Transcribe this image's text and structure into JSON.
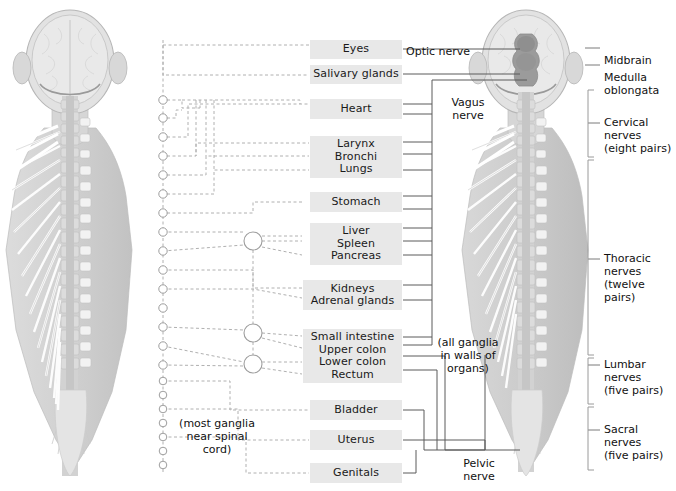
{
  "diagram": {
    "colors": {
      "box_fill": "#e8e8e8",
      "text": "#1a1a1a",
      "solid_line": "#555555",
      "dashed_line": "#aaaaaa",
      "bracket": "#888888",
      "figure_gray": "#c9c9c9",
      "figure_light": "#e4e4e4",
      "figure_dark": "#9a9a9a",
      "cord_dark": "#8d8d8d"
    },
    "organ_boxes": [
      {
        "id": "eyes",
        "lines": [
          "Eyes"
        ],
        "x": 310,
        "y": 40,
        "w": 92,
        "h": 19
      },
      {
        "id": "salivary",
        "lines": [
          "Salivary glands"
        ],
        "x": 310,
        "y": 65,
        "w": 92,
        "h": 19
      },
      {
        "id": "heart",
        "lines": [
          "Heart"
        ],
        "x": 310,
        "y": 99,
        "w": 92,
        "h": 20
      },
      {
        "id": "airway",
        "lines": [
          "Larynx",
          "Bronchi",
          "Lungs"
        ],
        "x": 310,
        "y": 136,
        "w": 92,
        "h": 42
      },
      {
        "id": "stomach",
        "lines": [
          "Stomach"
        ],
        "x": 310,
        "y": 192,
        "w": 92,
        "h": 20
      },
      {
        "id": "liver",
        "lines": [
          "Liver",
          "Spleen",
          "Pancreas"
        ],
        "x": 310,
        "y": 223,
        "w": 92,
        "h": 42
      },
      {
        "id": "kidneys",
        "lines": [
          "Kidneys",
          "Adrenal glands"
        ],
        "x": 303,
        "y": 280,
        "w": 99,
        "h": 30
      },
      {
        "id": "intestine",
        "lines": [
          "Small intestine",
          "Upper colon",
          "Lower colon",
          "Rectum"
        ],
        "x": 303,
        "y": 329,
        "w": 99,
        "h": 54
      },
      {
        "id": "bladder",
        "lines": [
          "Bladder"
        ],
        "x": 310,
        "y": 400,
        "w": 92,
        "h": 20
      },
      {
        "id": "uterus",
        "lines": [
          "Uterus"
        ],
        "x": 310,
        "y": 430,
        "w": 92,
        "h": 20
      },
      {
        "id": "genitals",
        "lines": [
          "Genitals"
        ],
        "x": 310,
        "y": 463,
        "w": 92,
        "h": 20
      }
    ],
    "nerve_labels": [
      {
        "id": "optic-nerve",
        "lines": [
          "Optic nerve"
        ],
        "x": 406,
        "y": 32,
        "w": 86,
        "align": "left"
      },
      {
        "id": "vagus-nerve",
        "lines": [
          "Vagus",
          "nerve"
        ],
        "x": 440,
        "y": 83,
        "w": 56,
        "align": "center"
      },
      {
        "id": "all-ganglia",
        "lines": [
          "(all ganglia",
          "in walls of",
          "organs)"
        ],
        "x": 434,
        "y": 323,
        "w": 68,
        "align": "center"
      },
      {
        "id": "pelvic-nerve",
        "lines": [
          "Pelvic",
          "nerve"
        ],
        "x": 452,
        "y": 444,
        "w": 52,
        "align": "center"
      },
      {
        "id": "most-ganglia",
        "lines": [
          "(most ganglia",
          "near spinal",
          "cord)"
        ],
        "x": 172,
        "y": 404,
        "w": 86,
        "align": "center"
      }
    ],
    "right_labels": [
      {
        "id": "midbrain",
        "lines": [
          "Midbrain"
        ],
        "x": 604,
        "y": 41,
        "tick_y": 48,
        "bracket": false
      },
      {
        "id": "medulla",
        "lines": [
          "Medulla",
          "oblongata"
        ],
        "x": 604,
        "y": 58,
        "tick_y": 65,
        "bracket": false
      },
      {
        "id": "cervical",
        "lines": [
          "Cervical",
          "nerves",
          "(eight pairs)"
        ],
        "x": 604,
        "y": 103,
        "tick_y": 123,
        "bracket": true,
        "b_top": 90,
        "b_bot": 157
      },
      {
        "id": "thoracic",
        "lines": [
          "Thoracic",
          "nerves",
          "(twelve pairs)"
        ],
        "x": 604,
        "y": 239,
        "tick_y": 259,
        "bracket": true,
        "b_top": 160,
        "b_bot": 355
      },
      {
        "id": "lumbar",
        "lines": [
          "Lumbar",
          "nerves",
          "(five pairs)"
        ],
        "x": 604,
        "y": 345,
        "tick_y": 365,
        "bracket": true,
        "b_top": 358,
        "b_bot": 404
      },
      {
        "id": "sacral",
        "lines": [
          "Sacral",
          "nerves",
          "(five pairs)"
        ],
        "x": 604,
        "y": 410,
        "tick_y": 430,
        "bracket": true,
        "b_top": 407,
        "b_bot": 470
      }
    ],
    "figures": {
      "left": {
        "id": "sympathetic-figure",
        "x": 8,
        "y": 8,
        "w": 148,
        "h": 478
      },
      "right": {
        "id": "parasympathetic-figure",
        "x": 462,
        "y": 8,
        "w": 136,
        "h": 478
      }
    },
    "ganglia_chain": {
      "x": 163,
      "small_radius": 4.2,
      "y_positions": [
        100,
        118,
        137,
        156,
        175,
        194,
        213,
        232,
        251,
        270,
        289,
        308,
        327,
        346,
        365,
        381,
        395,
        409,
        423,
        437,
        451,
        465
      ],
      "large_ganglia": [
        {
          "x": 253,
          "y": 241,
          "r": 9
        },
        {
          "x": 253,
          "y": 333,
          "r": 9
        },
        {
          "x": 253,
          "y": 364,
          "r": 9
        }
      ]
    }
  }
}
